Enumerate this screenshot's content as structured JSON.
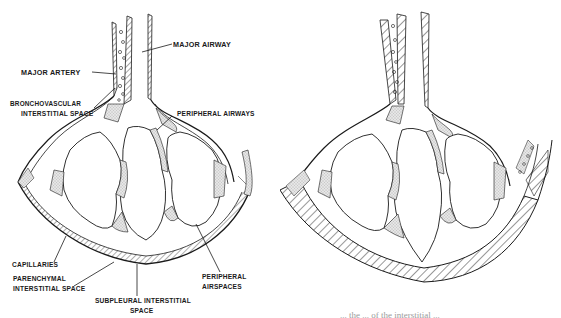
{
  "figure": {
    "left_panel": {
      "name": "labeled lung interstitium diagram",
      "labels": {
        "major_airway": "MAJOR AIRWAY",
        "major_artery": "MAJOR ARTERY",
        "bronchovascular_1": "BRONCHOVASCULAR",
        "bronchovascular_2": "INTERSTITIAL SPACE",
        "peripheral_airways": "PERIPHERAL AIRWAYS",
        "capillaries": "CAPILLARIES",
        "parenchymal_1": "PARENCHYMAL",
        "parenchymal_2": "INTERSTITIAL SPACE",
        "subpleural_1": "SUBPLEURAL INTERSTITIAL",
        "subpleural_2": "SPACE",
        "peripheral_airspaces_1": "PERIPHERAL",
        "peripheral_airspaces_2": "AIRSPACES"
      }
    },
    "right_panel": {
      "name": "unlabeled lung interstitium diagram with hatched interstitium"
    },
    "caption_fragment": "... the ... of the interstitial ..."
  },
  "colors": {
    "ink": "#1a1a1a",
    "stipple": "#c8c8c8",
    "paper": "#ffffff"
  }
}
